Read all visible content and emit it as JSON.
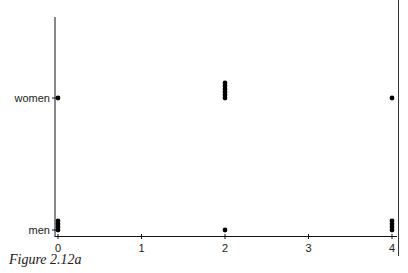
{
  "caption": "Figure 2.12a",
  "chart_data": {
    "type": "scatter",
    "title": "",
    "xlabel": "",
    "ylabel": "",
    "x_ticks": [
      "0",
      "1",
      "2",
      "3",
      "4"
    ],
    "y_categories": [
      "men",
      "women"
    ],
    "xlim": [
      0,
      4
    ],
    "grid": false,
    "points": [
      {
        "x": 0,
        "y": "women",
        "count": 1
      },
      {
        "x": 2,
        "y": "women",
        "count": 6
      },
      {
        "x": 4,
        "y": "women",
        "count": 1
      },
      {
        "x": 0,
        "y": "men",
        "count": 4
      },
      {
        "x": 2,
        "y": "men",
        "count": 1
      },
      {
        "x": 4,
        "y": "men",
        "count": 4
      }
    ]
  }
}
